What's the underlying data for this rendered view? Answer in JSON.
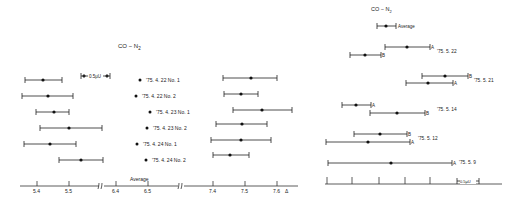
{
  "chart_data": [
    {
      "type": "scatter",
      "title": "CO - N2",
      "subtype": "error-bar (interval) plot, broken x-axis",
      "xlabel": "Δ",
      "x_ticks": [
        "5.4",
        "5.5",
        "6.4",
        "6.5",
        "7.4",
        "7.5",
        "7.6"
      ],
      "axis_breaks": [
        "between 5.5 and 6.4",
        "between 6.5 and 7.4"
      ],
      "scale_bar_label": "0.5μU",
      "bottom_label": "Average",
      "series": [
        {
          "name": "'75. 4. 22 No. 1",
          "low_group": {
            "center": 5.42,
            "low": 5.36,
            "high": 5.48
          },
          "mid_group": {
            "center": 6.48
          },
          "high_group": {
            "center": 7.52,
            "low": 7.44,
            "high": 7.6
          }
        },
        {
          "name": "'75. 4. 22 No. 2",
          "low_group": {
            "center": 5.43,
            "low": 5.35,
            "high": 5.51
          },
          "mid_group": {
            "center": 6.47
          },
          "high_group": {
            "center": 7.49,
            "low": 7.44,
            "high": 7.54
          }
        },
        {
          "name": "'75. 4. 23 No. 1",
          "low_group": {
            "center": 5.45,
            "low": 5.4,
            "high": 5.5
          },
          "mid_group": {
            "center": 6.51
          },
          "high_group": {
            "center": 7.55,
            "low": 7.46,
            "high": 7.64
          }
        },
        {
          "name": "'75. 4. 23 No. 2",
          "low_group": {
            "center": 5.5,
            "low": 5.41,
            "high": 5.6
          },
          "mid_group": {
            "center": 6.5
          },
          "high_group": {
            "center": 7.49,
            "low": 7.41,
            "high": 7.57
          }
        },
        {
          "name": "'75. 4. 24 No. 1",
          "low_group": {
            "center": 5.44,
            "low": 5.36,
            "high": 5.52
          },
          "mid_group": {
            "center": 6.47
          },
          "high_group": {
            "center": 7.49,
            "low": 7.39,
            "high": 7.58
          }
        },
        {
          "name": "'75. 4. 24 No. 2",
          "low_group": {
            "center": 5.54,
            "low": 5.47,
            "high": 5.61
          },
          "mid_group": {
            "center": 6.49
          },
          "high_group": {
            "center": 7.45,
            "low": 7.4,
            "high": 7.51
          }
        }
      ]
    },
    {
      "type": "scatter",
      "title": "CO - N2",
      "subtype": "error-bar (interval) plot",
      "scale_bar_label": "0.5μU",
      "legend": [
        {
          "label": "Average"
        }
      ],
      "series": [
        {
          "name": "Average",
          "center": 0.53,
          "low": 0.42,
          "high": 0.62
        },
        {
          "name": "'75. 5. 22 A",
          "center": 0.93,
          "low": 0.65,
          "high": 1.22
        },
        {
          "name": "'75. 5. 22 B",
          "center": 0.19,
          "low": 0.0,
          "high": 0.38
        },
        {
          "name": "'75. 5. 21 B",
          "center": 1.42,
          "low": 1.15,
          "high": 1.69
        },
        {
          "name": "'75. 5. 21 A",
          "center": 1.31,
          "low": 1.06,
          "high": 1.58
        },
        {
          "name": "'75. 5. 14 A",
          "center": 0.46,
          "low": 0.26,
          "high": 0.6
        },
        {
          "name": "'75. 5. 14 B",
          "center": 0.9,
          "low": 0.6,
          "high": 1.24
        },
        {
          "name": "'75. 5. 12 B",
          "center": 0.72,
          "low": 0.48,
          "high": 1.04
        },
        {
          "name": "'75. 5. 12 A",
          "center": 0.53,
          "low": 0.0,
          "high": 1.06
        },
        {
          "name": "'75. 5. 9 A",
          "center": 0.9,
          "low": 0.02,
          "high": 1.76
        }
      ],
      "x_ticks_count": 5,
      "grid": false
    }
  ],
  "left_panel": {
    "title": "CO − N",
    "title_sub": "2",
    "scale_bar": "0.5μU",
    "average_label": "Average",
    "delta_symbol": "Δ",
    "ticks": [
      {
        "x": 37,
        "label": "5.4"
      },
      {
        "x": 69,
        "label": "5.5"
      },
      {
        "x": 116,
        "label": "6.4"
      },
      {
        "x": 148,
        "label": "6.5"
      },
      {
        "x": 213,
        "label": "7.4"
      },
      {
        "x": 245,
        "label": "7.5"
      },
      {
        "x": 277,
        "label": "7.6"
      }
    ],
    "rows": [
      {
        "label": "'75. 4. 22 No. 1",
        "y": 80,
        "a": [
          25,
          43,
          62
        ],
        "mid": 140,
        "b": [
          223,
          251,
          277
        ],
        "by": 78
      },
      {
        "label": "'75. 4. 22 No. 2",
        "y": 96,
        "a": [
          22,
          48,
          73
        ],
        "mid": 136,
        "b": [
          224,
          241,
          258
        ],
        "by": 94
      },
      {
        "label": "'75. 4. 23 No. 1",
        "y": 112,
        "a": [
          36,
          54,
          69
        ],
        "mid": 150,
        "b": [
          233,
          262,
          292
        ],
        "by": 110
      },
      {
        "label": "'75. 4. 23 No. 2",
        "y": 128,
        "a": [
          40,
          69,
          102
        ],
        "mid": 147,
        "b": [
          216,
          242,
          267
        ],
        "by": 124
      },
      {
        "label": "'75. 4. 24 No. 1",
        "y": 144,
        "a": [
          24,
          50,
          76
        ],
        "mid": 137,
        "b": [
          211,
          241,
          271
        ],
        "by": 140
      },
      {
        "label": "'75. 4. 24 No. 2",
        "y": 160,
        "a": [
          59,
          81,
          103
        ],
        "mid": 146,
        "b": [
          213,
          230,
          249
        ],
        "by": 155
      }
    ]
  },
  "right_panel": {
    "title": "CO − N",
    "title_sub": "2",
    "scale_bar": "0.5μU",
    "legend_label": "Average",
    "ticks_x": [
      327,
      352,
      379,
      405,
      430
    ],
    "bars": [
      {
        "y": 26,
        "x1": 377,
        "xc": 386,
        "x2": 396,
        "end": "",
        "label": "Average"
      },
      {
        "y": 47,
        "x1": 385,
        "xc": 407,
        "x2": 430,
        "end": "A",
        "label": ""
      },
      {
        "y": 55,
        "x1": 350,
        "xc": 365,
        "x2": 381,
        "end": "B",
        "label": ""
      },
      {
        "y": 76,
        "x1": 422,
        "xc": 445,
        "x2": 468,
        "end": "B",
        "label": ""
      },
      {
        "y": 83,
        "x1": 406,
        "xc": 428,
        "x2": 453,
        "end": "A",
        "label": ""
      },
      {
        "y": 105,
        "x1": 342,
        "xc": 356,
        "x2": 371,
        "end": "A",
        "label": ""
      },
      {
        "y": 113,
        "x1": 370,
        "xc": 397,
        "x2": 425,
        "end": "B",
        "label": ""
      },
      {
        "y": 134,
        "x1": 354,
        "xc": 380,
        "x2": 407,
        "end": "B",
        "label": ""
      },
      {
        "y": 142,
        "x1": 326,
        "xc": 368,
        "x2": 410,
        "end": "A",
        "label": ""
      },
      {
        "y": 163,
        "x1": 328,
        "xc": 391,
        "x2": 452,
        "end": "A",
        "label": ""
      }
    ],
    "dates": [
      {
        "x": 437,
        "y": 53,
        "label": "'75. 5. 22"
      },
      {
        "x": 474,
        "y": 82,
        "label": "'75. 5. 21"
      },
      {
        "x": 437,
        "y": 111,
        "label": "'75. 5. 14"
      },
      {
        "x": 418,
        "y": 140,
        "label": "'75. 5. 12"
      },
      {
        "x": 459,
        "y": 164,
        "label": "'75. 5. 9"
      }
    ]
  }
}
